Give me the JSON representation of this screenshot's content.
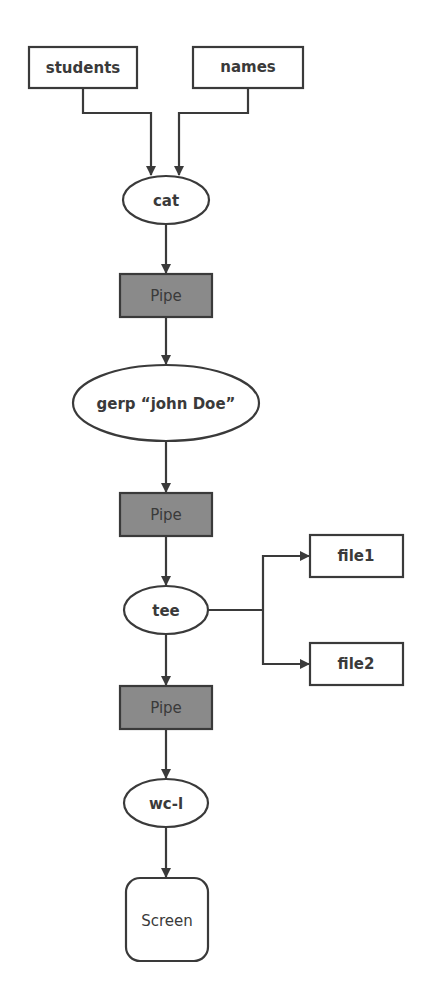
{
  "diagram": {
    "type": "flowchart",
    "colors": {
      "stroke": "#3a3a3a",
      "pipe_fill": "#8a8a8a",
      "node_fill": "#ffffff",
      "text": "#3a3a3a"
    },
    "inputs": [
      {
        "id": "students",
        "label": "students"
      },
      {
        "id": "names",
        "label": "names"
      }
    ],
    "nodes": {
      "cat": {
        "label": "cat"
      },
      "pipe1": {
        "label": "Pipe"
      },
      "grep": {
        "label": "gerp “john Doe”"
      },
      "pipe2": {
        "label": "Pipe"
      },
      "tee": {
        "label": "tee"
      },
      "pipe3": {
        "label": "Pipe"
      },
      "wc": {
        "label": "wc-l"
      },
      "screen": {
        "label": "Screen"
      }
    },
    "outputs": [
      {
        "id": "file1",
        "label": "file1"
      },
      {
        "id": "file2",
        "label": "file2"
      }
    ],
    "edges": [
      [
        "students",
        "cat"
      ],
      [
        "names",
        "cat"
      ],
      [
        "cat",
        "pipe1"
      ],
      [
        "pipe1",
        "grep"
      ],
      [
        "grep",
        "pipe2"
      ],
      [
        "pipe2",
        "tee"
      ],
      [
        "tee",
        "file1"
      ],
      [
        "tee",
        "file2"
      ],
      [
        "tee",
        "pipe3"
      ],
      [
        "pipe3",
        "wc"
      ],
      [
        "wc",
        "screen"
      ]
    ]
  }
}
